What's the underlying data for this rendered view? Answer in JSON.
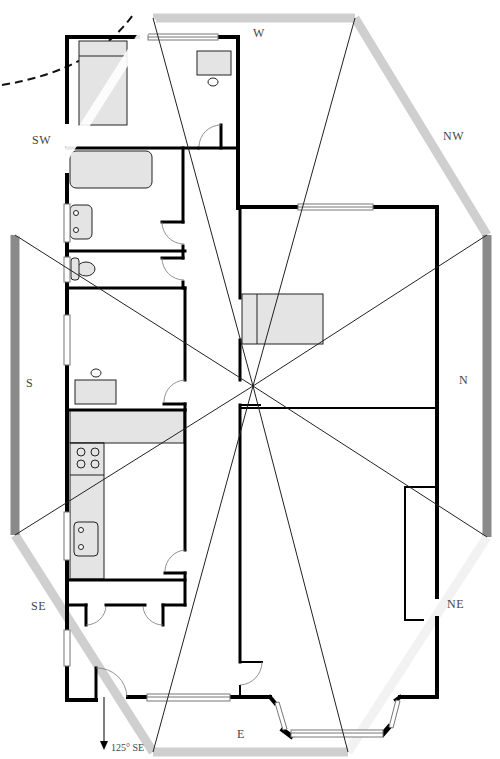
{
  "diagram": {
    "type": "feng-shui bagua floor plan overlay",
    "colors": {
      "wall": "#000000",
      "fixture_fill": "#e4e4e4",
      "fixture_stroke": "#222222",
      "bagua_light": "#cfcfcf",
      "bagua_dark": "#8a8a8a",
      "sector_line": "#222222",
      "window_fill": "#ffffff",
      "window_stroke": "#777777"
    },
    "center": {
      "x": 253,
      "y": 386
    },
    "directions": [
      {
        "id": "W",
        "label": "W",
        "x": 253,
        "y": 27
      },
      {
        "id": "NW",
        "label": "NW",
        "x": 444,
        "y": 140
      },
      {
        "id": "N",
        "label": "N",
        "x": 458,
        "y": 386
      },
      {
        "id": "NE",
        "label": "NE",
        "x": 448,
        "y": 609
      },
      {
        "id": "E",
        "label": "E",
        "x": 237,
        "y": 737
      },
      {
        "id": "SE",
        "label": "SE",
        "x": 32,
        "y": 610
      },
      {
        "id": "S",
        "label": "S",
        "x": 26,
        "y": 387
      },
      {
        "id": "SW",
        "label": "SW",
        "x": 33,
        "y": 143
      }
    ],
    "orientation_note": {
      "label": "125° SE",
      "x": 111,
      "y": 741
    }
  }
}
